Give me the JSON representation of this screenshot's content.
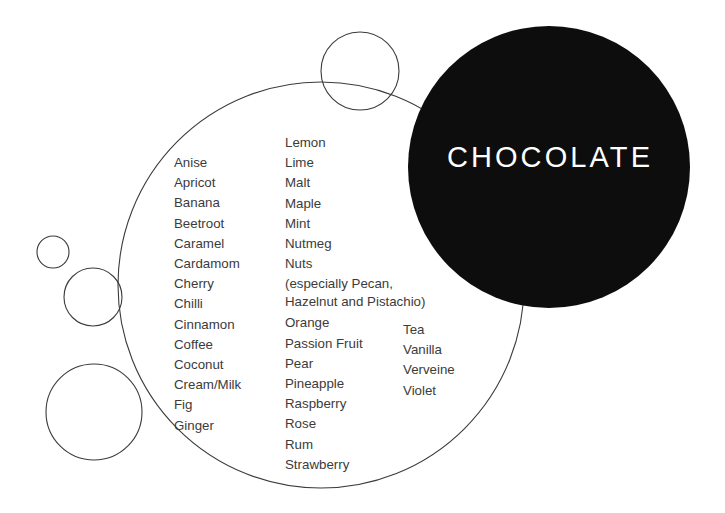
{
  "hub": {
    "label": "CHOCOLATE",
    "fill_color": "#0d0d0d",
    "text_color": "#ffffff"
  },
  "palette": {
    "background": "#ffffff",
    "stroke": "#3b3b3b",
    "text": "#3b3b3b"
  },
  "columns": {
    "column_1": [
      "Anise",
      "Apricot",
      "Banana",
      "Beetroot",
      "Caramel",
      "Cardamom",
      "Cherry",
      "Chilli",
      "Cinnamon",
      "Coffee",
      "Coconut",
      "Cream/Milk",
      "Fig",
      "Ginger"
    ],
    "column_2": [
      "Lemon",
      "Lime",
      "Malt",
      "Maple",
      "Mint",
      "Nutmeg",
      "Nuts",
      "Orange",
      "Passion Fruit",
      "Pear",
      "Pineapple",
      "Raspberry",
      "Rose",
      "Rum",
      "Strawberry"
    ],
    "column_2_note_line_1": "(especially Pecan,",
    "column_2_note_line_2": "Hazelnut and Pistachio)",
    "column_3": [
      "Tea",
      "Vanilla",
      "Verveine",
      "Violet"
    ]
  },
  "circles": [
    {
      "name": "hub-circle-chocolate",
      "cx": 549,
      "cy": 167,
      "r": 141,
      "filled": true
    },
    {
      "name": "main-outline-circle",
      "cx": 321,
      "cy": 285,
      "r": 203,
      "filled": false
    },
    {
      "name": "small-circle-top",
      "cx": 360,
      "cy": 71,
      "r": 39,
      "filled": false
    },
    {
      "name": "small-circle-left-upper",
      "cx": 53,
      "cy": 252,
      "r": 16,
      "filled": false
    },
    {
      "name": "small-circle-left-middle",
      "cx": 93,
      "cy": 297,
      "r": 29,
      "filled": false
    },
    {
      "name": "small-circle-left-lower",
      "cx": 94,
      "cy": 412,
      "r": 48,
      "filled": false
    }
  ]
}
